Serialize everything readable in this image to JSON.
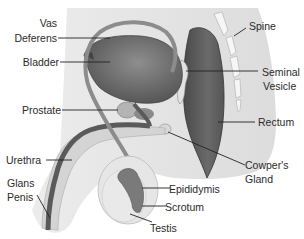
{
  "diagram": {
    "colors": {
      "body_silhouette": "#e6e6e6",
      "organ_dark": "#5a5a5a",
      "organ_mid": "#8a8a8a",
      "organ_light": "#c4c4c4",
      "bone": "#f4f4f4",
      "leader_line": "#222222",
      "text": "#2a2a2a"
    },
    "labels": {
      "vas_deferens_1": "Vas",
      "vas_deferens_2": "Deferens",
      "bladder": "Bladder",
      "prostate": "Prostate",
      "urethra": "Urethra",
      "glans_penis_1": "Glans",
      "glans_penis_2": "Penis",
      "spine": "Spine",
      "seminal_vesicle_1": "Seminal",
      "seminal_vesicle_2": "Vesicle",
      "rectum": "Rectum",
      "cowpers_gland_1": "Cowper's",
      "cowpers_gland_2": "Gland",
      "epididymis": "Epididymis",
      "scrotum": "Scrotum",
      "testis": "Testis"
    }
  }
}
